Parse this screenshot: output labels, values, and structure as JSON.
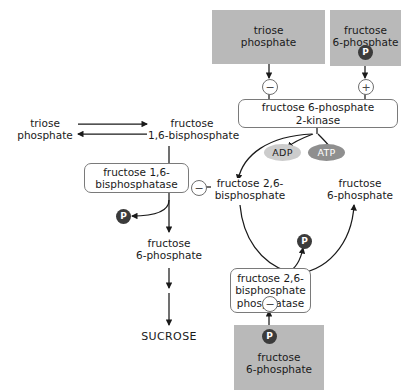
{
  "diagram": {
    "colors": {
      "grey_box": "#b9b9b9",
      "enzyme_box_border": "#7a7a7a",
      "phosphate_circle": "#3b3b3b",
      "adp_fill": "#cccccc",
      "atp_fill": "#8f8f8f",
      "arrow": "#1a1a1a",
      "background": "#ffffff"
    },
    "metabolite_boxes": [
      {
        "id": "triose-phosphate-top",
        "line1": "triose",
        "line2": "phosphate",
        "shaded": true
      },
      {
        "id": "fructose-6-phosphate-top",
        "line1": "fructose",
        "line2": "6-phosphate",
        "shaded": true,
        "phosphate": "P"
      },
      {
        "id": "fructose-6-phosphate-bottom",
        "line1": "fructose",
        "line2": "6-phosphate",
        "shaded": true,
        "phosphate": "P"
      }
    ],
    "enzyme_boxes": [
      {
        "id": "fructose-6-phosphate-2-kinase",
        "line1": "fructose 6-phosphate",
        "line2": "2-kinase"
      },
      {
        "id": "fructose-1-6-bisphosphatase",
        "line1": "fructose 1,6-",
        "line2": "bisphosphatase"
      },
      {
        "id": "fructose-2-6-bisphosphate-phosphatase",
        "line1": "fructose 2,6-",
        "line2": "bisphosphate",
        "line3": "phosphatase"
      }
    ],
    "plain_labels": [
      {
        "id": "triose-phosphate-left",
        "line1": "triose",
        "line2": "phosphate"
      },
      {
        "id": "fructose-1-6-bisphosphate",
        "line1": "fructose",
        "line2": "1,6-bisphosphate"
      },
      {
        "id": "fructose-2-6-bisphosphate",
        "line1": "fructose 2,6-",
        "line2": "bisphosphate"
      },
      {
        "id": "fructose-6-phosphate-cycle",
        "line1": "fructose",
        "line2": "6-phosphate"
      },
      {
        "id": "fructose-6-phosphate-mid",
        "line1": "fructose",
        "line2": "6-phosphate"
      },
      {
        "id": "sucrose",
        "line1": "SUCROSE"
      }
    ],
    "nucleotides": [
      {
        "id": "adp",
        "label": "ADP"
      },
      {
        "id": "atp",
        "label": "ATP"
      }
    ],
    "signs": [
      {
        "id": "minus-kinase",
        "symbol": "−"
      },
      {
        "id": "plus-kinase",
        "symbol": "+"
      },
      {
        "id": "minus-fbpase",
        "symbol": "−"
      },
      {
        "id": "minus-f26bpase",
        "symbol": "−"
      }
    ],
    "phosphate_groups": [
      {
        "id": "p-f6p-top",
        "label": "P"
      },
      {
        "id": "p-fbpase-release",
        "label": "P"
      },
      {
        "id": "p-cycle",
        "label": "P"
      },
      {
        "id": "p-f6p-bottom",
        "label": "P"
      }
    ]
  }
}
